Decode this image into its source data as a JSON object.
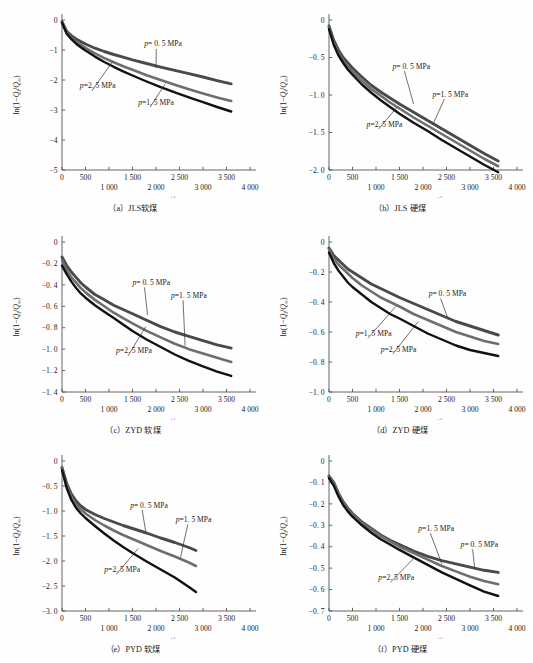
{
  "figure": {
    "width": 533,
    "height": 663,
    "series_colors": [
      "#4a4a4a",
      "#6e6e6e",
      "#111111"
    ],
    "axis_color": "#555555"
  },
  "common": {
    "xlabel": "t/s",
    "ylabel_prefix": "ln(1−",
    "ylabel_qt": "Q",
    "ylabel_sub_t": "t",
    "ylabel_slash": "/",
    "ylabel_qinf": "Q",
    "ylabel_sub_inf": "∞",
    "ylabel_suffix": ")",
    "ylabel_full": "ln(1−Qt/Q∞)",
    "xticks_top": [
      "0",
      "500",
      "1 500",
      "2 500",
      "3 500"
    ],
    "xticks_bottom": [
      "1 000",
      "2 000",
      "3 000",
      "4 000"
    ],
    "xtick_values_top": [
      0,
      500,
      1500,
      2500,
      3500
    ],
    "xtick_values_bottom": [
      1000,
      2000,
      3000,
      4000
    ],
    "label_p": "p",
    "label_05": "= 0. 5 MPa",
    "label_15": "=1. 5 MPa",
    "label_25": "=2. 5 MPa"
  },
  "chart_data": [
    {
      "id": "a",
      "type": "line",
      "caption": "（a）JLS软煤",
      "title": "",
      "xlabel": "t/s",
      "ylabel": "ln(1−Qt/Q∞)",
      "xlim": [
        0,
        4000
      ],
      "ylim": [
        -5,
        0
      ],
      "yticks": [
        "0",
        "−1",
        "−2",
        "−3",
        "−4",
        "−5"
      ],
      "ytick_values": [
        0,
        -1,
        -2,
        -3,
        -4,
        -5
      ],
      "grid": false,
      "legend_position": "inline-annotations",
      "x": [
        0,
        100,
        200,
        300,
        400,
        500,
        700,
        900,
        1100,
        1300,
        1500,
        1800,
        2100,
        2400,
        2700,
        3000,
        3300,
        3600
      ],
      "series": [
        {
          "name": "p = 0. 5 MPa",
          "values": [
            -0.05,
            -0.38,
            -0.52,
            -0.63,
            -0.72,
            -0.8,
            -0.94,
            -1.05,
            -1.15,
            -1.24,
            -1.33,
            -1.45,
            -1.57,
            -1.68,
            -1.79,
            -1.9,
            -2.02,
            -2.13
          ]
        },
        {
          "name": "p = 1. 5 MPa",
          "values": [
            -0.07,
            -0.42,
            -0.59,
            -0.72,
            -0.83,
            -0.93,
            -1.11,
            -1.27,
            -1.41,
            -1.54,
            -1.66,
            -1.84,
            -2.0,
            -2.16,
            -2.31,
            -2.45,
            -2.58,
            -2.7
          ]
        },
        {
          "name": "p = 2. 5 MPa",
          "values": [
            -0.09,
            -0.46,
            -0.64,
            -0.79,
            -0.91,
            -1.02,
            -1.22,
            -1.4,
            -1.56,
            -1.71,
            -1.85,
            -2.05,
            -2.24,
            -2.41,
            -2.58,
            -2.74,
            -2.9,
            -3.05
          ]
        }
      ],
      "annotations": [
        {
          "label": "0.5",
          "text_x": 1750,
          "text_y": -0.88,
          "tip_x": 2000,
          "tip_y": -1.6
        },
        {
          "label": "2.5",
          "text_x": 380,
          "text_y": -2.28,
          "tip_x": 1080,
          "tip_y": -1.38
        },
        {
          "label": "1.5",
          "text_x": 1620,
          "text_y": -2.82,
          "tip_x": 2200,
          "tip_y": -2.12
        }
      ]
    },
    {
      "id": "b",
      "type": "line",
      "caption": "（b）JLS 硬煤",
      "title": "",
      "xlabel": "t/s",
      "ylabel": "ln(1−Qt/Q∞)",
      "xlim": [
        0,
        4000
      ],
      "ylim": [
        -2.0,
        0
      ],
      "yticks": [
        "0",
        "−0. 5",
        "−1. 0",
        "−1. 5",
        "−2. 0"
      ],
      "ytick_values": [
        0,
        -0.5,
        -1.0,
        -1.5,
        -2.0
      ],
      "grid": false,
      "legend_position": "inline-annotations",
      "x": [
        0,
        100,
        200,
        300,
        400,
        500,
        700,
        900,
        1100,
        1300,
        1500,
        1800,
        2100,
        2400,
        2700,
        3000,
        3300,
        3600
      ],
      "series": [
        {
          "name": "p = 0. 5 MPa",
          "values": [
            -0.08,
            -0.27,
            -0.4,
            -0.5,
            -0.57,
            -0.64,
            -0.76,
            -0.87,
            -0.96,
            -1.04,
            -1.12,
            -1.23,
            -1.34,
            -1.45,
            -1.56,
            -1.67,
            -1.78,
            -1.88
          ]
        },
        {
          "name": "p = 1. 5 MPa",
          "values": [
            -0.1,
            -0.3,
            -0.44,
            -0.54,
            -0.62,
            -0.69,
            -0.81,
            -0.92,
            -1.01,
            -1.1,
            -1.18,
            -1.3,
            -1.41,
            -1.52,
            -1.63,
            -1.74,
            -1.85,
            -1.95
          ]
        },
        {
          "name": "p = 2. 5 MPa",
          "values": [
            -0.12,
            -0.33,
            -0.47,
            -0.57,
            -0.66,
            -0.73,
            -0.86,
            -0.97,
            -1.07,
            -1.16,
            -1.25,
            -1.37,
            -1.48,
            -1.6,
            -1.71,
            -1.82,
            -1.93,
            -2.03
          ]
        }
      ],
      "annotations": [
        {
          "label": "0.5",
          "text_x": 1350,
          "text_y": -0.65,
          "tip_x": 1800,
          "tip_y": -1.12
        },
        {
          "label": "1.5",
          "text_x": 2200,
          "text_y": -1.02,
          "tip_x": 2220,
          "tip_y": -1.38
        },
        {
          "label": "2.5",
          "text_x": 800,
          "text_y": -1.42,
          "tip_x": 1450,
          "tip_y": -1.16
        }
      ]
    },
    {
      "id": "c",
      "type": "line",
      "caption": "（c）ZYD 软煤",
      "title": "",
      "xlabel": "t/s",
      "ylabel": "ln(1−Qt/Q∞)",
      "xlim": [
        0,
        4000
      ],
      "ylim": [
        -1.4,
        0
      ],
      "yticks": [
        "0",
        "−0. 2",
        "−0. 4",
        "−0. 6",
        "−0. 8",
        "−1. 0",
        "−1. 2",
        "−1. 4"
      ],
      "ytick_values": [
        0,
        -0.2,
        -0.4,
        -0.6,
        -0.8,
        -1.0,
        -1.2,
        -1.4
      ],
      "grid": false,
      "legend_position": "inline-annotations",
      "x": [
        0,
        100,
        200,
        300,
        400,
        500,
        700,
        900,
        1100,
        1300,
        1500,
        1800,
        2100,
        2400,
        2700,
        3000,
        3300,
        3600
      ],
      "series": [
        {
          "name": "p = 0. 5 MPa",
          "values": [
            -0.14,
            -0.22,
            -0.28,
            -0.33,
            -0.38,
            -0.42,
            -0.49,
            -0.54,
            -0.59,
            -0.63,
            -0.67,
            -0.73,
            -0.79,
            -0.84,
            -0.88,
            -0.92,
            -0.96,
            -0.99
          ]
        },
        {
          "name": "p = 1. 5 MPa",
          "values": [
            -0.17,
            -0.26,
            -0.33,
            -0.38,
            -0.43,
            -0.47,
            -0.54,
            -0.6,
            -0.66,
            -0.71,
            -0.76,
            -0.83,
            -0.89,
            -0.95,
            -1.0,
            -1.04,
            -1.08,
            -1.12
          ]
        },
        {
          "name": "p = 2. 5 MPa",
          "values": [
            -0.22,
            -0.3,
            -0.37,
            -0.43,
            -0.48,
            -0.52,
            -0.59,
            -0.65,
            -0.71,
            -0.77,
            -0.83,
            -0.91,
            -0.98,
            -1.05,
            -1.11,
            -1.16,
            -1.21,
            -1.25
          ]
        }
      ],
      "annotations": [
        {
          "label": "0.5",
          "text_x": 1500,
          "text_y": -0.4,
          "tip_x": 1820,
          "tip_y": -0.68
        },
        {
          "label": "1.5",
          "text_x": 2320,
          "text_y": -0.52,
          "tip_x": 2620,
          "tip_y": -0.97
        },
        {
          "label": "2.5",
          "text_x": 1150,
          "text_y": -1.04,
          "tip_x": 1780,
          "tip_y": -0.79
        }
      ]
    },
    {
      "id": "d",
      "type": "line",
      "caption": "（d）ZYD 硬煤",
      "title": "",
      "xlabel": "t/s",
      "ylabel": "ln(1−Qt/Q∞)",
      "xlim": [
        0,
        4000
      ],
      "ylim": [
        -1.0,
        0
      ],
      "yticks": [
        "0",
        "−0. 2",
        "−0. 4",
        "−0. 6",
        "−0. 8",
        "−1. 0"
      ],
      "ytick_values": [
        0,
        -0.2,
        -0.4,
        -0.6,
        -0.8,
        -1.0
      ],
      "grid": false,
      "legend_position": "inline-annotations",
      "x": [
        0,
        100,
        200,
        300,
        400,
        500,
        700,
        900,
        1100,
        1300,
        1500,
        1800,
        2100,
        2400,
        2700,
        3000,
        3300,
        3600
      ],
      "series": [
        {
          "name": "p = 0. 5 MPa",
          "values": [
            -0.04,
            -0.09,
            -0.12,
            -0.15,
            -0.18,
            -0.2,
            -0.24,
            -0.28,
            -0.31,
            -0.34,
            -0.37,
            -0.41,
            -0.45,
            -0.49,
            -0.53,
            -0.56,
            -0.59,
            -0.62
          ]
        },
        {
          "name": "p = 1. 5 MPa",
          "values": [
            -0.05,
            -0.11,
            -0.15,
            -0.18,
            -0.21,
            -0.24,
            -0.29,
            -0.33,
            -0.37,
            -0.4,
            -0.43,
            -0.48,
            -0.52,
            -0.56,
            -0.6,
            -0.63,
            -0.66,
            -0.68
          ]
        },
        {
          "name": "p = 2. 5 MPa",
          "values": [
            -0.07,
            -0.14,
            -0.19,
            -0.23,
            -0.27,
            -0.3,
            -0.35,
            -0.4,
            -0.44,
            -0.48,
            -0.51,
            -0.56,
            -0.61,
            -0.65,
            -0.69,
            -0.72,
            -0.74,
            -0.76
          ]
        }
      ],
      "annotations": [
        {
          "label": "0.5",
          "text_x": 2120,
          "text_y": -0.36,
          "tip_x": 2520,
          "tip_y": -0.5
        },
        {
          "label": "1.5",
          "text_x": 570,
          "text_y": -0.625,
          "tip_x": 1420,
          "tip_y": -0.43
        },
        {
          "label": "2.5",
          "text_x": 1100,
          "text_y": -0.73,
          "tip_x": 1900,
          "tip_y": -0.53
        }
      ]
    },
    {
      "id": "e",
      "type": "line",
      "caption": "（e）PYD 软煤",
      "title": "",
      "xlabel": "t/s",
      "ylabel": "ln(1−Qt/Q∞)",
      "xlim": [
        0,
        4000
      ],
      "ylim": [
        -3.0,
        0
      ],
      "yticks": [
        "0",
        "−0. 5",
        "−1. 0",
        "−1. 5",
        "−2. 0",
        "−2. 5",
        "−3. 0"
      ],
      "ytick_values": [
        0,
        -0.5,
        -1.0,
        -1.5,
        -2.0,
        -2.5,
        -3.0
      ],
      "grid": false,
      "legend_position": "inline-annotations",
      "x": [
        0,
        100,
        200,
        300,
        400,
        500,
        700,
        900,
        1100,
        1300,
        1500,
        1800,
        2100,
        2400,
        2700,
        2850
      ],
      "series": [
        {
          "name": "p = 0. 5 MPa",
          "values": [
            -0.13,
            -0.45,
            -0.66,
            -0.8,
            -0.9,
            -0.97,
            -1.07,
            -1.15,
            -1.22,
            -1.29,
            -1.35,
            -1.44,
            -1.54,
            -1.63,
            -1.73,
            -1.79
          ]
        },
        {
          "name": "p = 1. 5 MPa",
          "values": [
            -0.15,
            -0.5,
            -0.72,
            -0.87,
            -0.97,
            -1.05,
            -1.18,
            -1.29,
            -1.39,
            -1.48,
            -1.56,
            -1.68,
            -1.8,
            -1.91,
            -2.03,
            -2.1
          ]
        },
        {
          "name": "p = 2. 5 MPa",
          "values": [
            -0.18,
            -0.54,
            -0.78,
            -0.94,
            -1.05,
            -1.14,
            -1.3,
            -1.45,
            -1.59,
            -1.72,
            -1.84,
            -2.01,
            -2.17,
            -2.33,
            -2.52,
            -2.62
          ]
        }
      ],
      "annotations": [
        {
          "label": "0.5",
          "text_x": 1450,
          "text_y": -0.93,
          "tip_x": 1780,
          "tip_y": -1.4
        },
        {
          "label": "1.5",
          "text_x": 2420,
          "text_y": -1.22,
          "tip_x": 2520,
          "tip_y": -1.93
        },
        {
          "label": "2.5",
          "text_x": 900,
          "text_y": -2.22,
          "tip_x": 1620,
          "tip_y": -1.75
        }
      ]
    },
    {
      "id": "f",
      "type": "line",
      "caption": "（f）PYD 硬煤",
      "title": "",
      "xlabel": "t/s",
      "ylabel": "ln(1−Qt/Q∞)",
      "xlim": [
        0,
        4000
      ],
      "ylim": [
        -0.7,
        0
      ],
      "yticks": [
        "0",
        "−0. 1",
        "−0. 2",
        "−0. 3",
        "−0. 4",
        "−0. 5",
        "−0. 6",
        "−0. 7"
      ],
      "ytick_values": [
        0,
        -0.1,
        -0.2,
        -0.3,
        -0.4,
        -0.5,
        -0.6,
        -0.7
      ],
      "grid": false,
      "legend_position": "inline-annotations",
      "x": [
        0,
        100,
        200,
        300,
        400,
        500,
        700,
        900,
        1100,
        1300,
        1500,
        1800,
        2100,
        2400,
        2700,
        3000,
        3300,
        3600
      ],
      "series": [
        {
          "name": "p = 0. 5 MPa",
          "values": [
            -0.07,
            -0.1,
            -0.15,
            -0.19,
            -0.22,
            -0.245,
            -0.285,
            -0.315,
            -0.345,
            -0.37,
            -0.39,
            -0.42,
            -0.445,
            -0.465,
            -0.48,
            -0.495,
            -0.51,
            -0.52
          ]
        },
        {
          "name": "p = 1. 5 MPa",
          "values": [
            -0.075,
            -0.105,
            -0.155,
            -0.195,
            -0.225,
            -0.25,
            -0.29,
            -0.32,
            -0.35,
            -0.375,
            -0.4,
            -0.43,
            -0.46,
            -0.49,
            -0.515,
            -0.54,
            -0.56,
            -0.575
          ]
        },
        {
          "name": "p = 2. 5 MPa",
          "values": [
            -0.08,
            -0.115,
            -0.165,
            -0.205,
            -0.235,
            -0.26,
            -0.3,
            -0.335,
            -0.365,
            -0.39,
            -0.415,
            -0.45,
            -0.485,
            -0.52,
            -0.55,
            -0.58,
            -0.61,
            -0.63
          ]
        }
      ],
      "annotations": [
        {
          "label": "1.5",
          "text_x": 1900,
          "text_y": -0.325,
          "tip_x": 2400,
          "tip_y": -0.48
        },
        {
          "label": "0.5",
          "text_x": 2800,
          "text_y": -0.4,
          "tip_x": 3100,
          "tip_y": -0.5
        },
        {
          "label": "2.5",
          "text_x": 1050,
          "text_y": -0.555,
          "tip_x": 1800,
          "tip_y": -0.455
        }
      ]
    }
  ]
}
